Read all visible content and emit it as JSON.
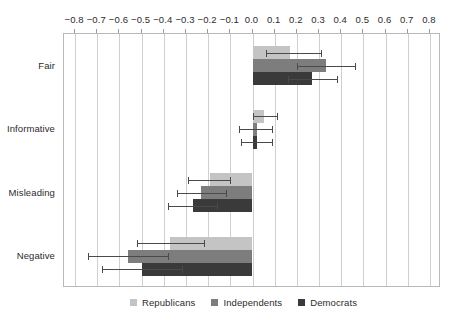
{
  "chart_data": {
    "type": "bar",
    "orientation": "horizontal",
    "title": "",
    "subtitle": "",
    "xlabel": "",
    "ylabel": "",
    "xlim": [
      -0.85,
      0.85
    ],
    "xticks": [
      -0.8,
      -0.7,
      -0.6,
      -0.5,
      -0.4,
      -0.3,
      -0.2,
      -0.1,
      0.0,
      0.1,
      0.2,
      0.3,
      0.4,
      0.5,
      0.6,
      0.7,
      0.8
    ],
    "xtick_labels": [
      "−0.8",
      "−0.7",
      "−0.6",
      "−0.5",
      "−0.4",
      "−0.3",
      "−0.2",
      "−0.1",
      "0.0",
      "0.1",
      "0.2",
      "0.3",
      "0.4",
      "0.5",
      "0.6",
      "0.7",
      "0.8"
    ],
    "xaxis_position": "top",
    "grid": true,
    "grid_axis": "x",
    "legend_position": "bottom-center",
    "categories": [
      "Fair",
      "Informative",
      "Misleading",
      "Negative"
    ],
    "series": [
      {
        "name": "Republicans",
        "color": "#c4c4c4",
        "values": [
          0.17,
          0.05,
          -0.19,
          -0.37
        ],
        "err_low": [
          0.06,
          0.0,
          -0.29,
          -0.52
        ],
        "err_high": [
          0.31,
          0.11,
          -0.1,
          -0.22
        ]
      },
      {
        "name": "Independents",
        "color": "#7d7d7d",
        "values": [
          0.33,
          0.02,
          -0.23,
          -0.56
        ],
        "err_low": [
          0.2,
          -0.06,
          -0.34,
          -0.74
        ],
        "err_high": [
          0.46,
          0.09,
          -0.12,
          -0.38
        ]
      },
      {
        "name": "Democrats",
        "color": "#3a3a3a",
        "values": [
          0.27,
          0.02,
          -0.27,
          -0.5
        ],
        "err_low": [
          0.16,
          -0.05,
          -0.38,
          -0.68
        ],
        "err_high": [
          0.38,
          0.09,
          -0.16,
          -0.32
        ]
      }
    ]
  },
  "legend": {
    "items": [
      {
        "label": "Republicans"
      },
      {
        "label": "Independents"
      },
      {
        "label": "Democrats"
      }
    ]
  },
  "axes": {
    "y_labels": [
      "Fair",
      "Informative",
      "Misleading",
      "Negative"
    ]
  },
  "colors": {
    "republicans": "#c4c4c4",
    "independents": "#7d7d7d",
    "democrats": "#3a3a3a",
    "grid": "#cfcfcf",
    "frame": "#b9b9b9",
    "error": "#4a4a4a",
    "text": "#2b2b2b",
    "background": "#ffffff"
  }
}
